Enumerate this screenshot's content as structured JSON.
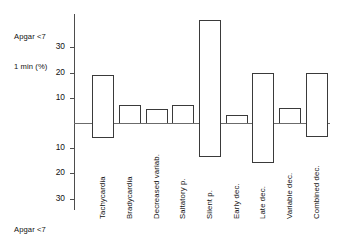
{
  "axis": {
    "top_caption_line1": "Apgar <7",
    "top_caption_line2": "1 min (%)",
    "bottom_caption_line1": "Apgar <7",
    "bottom_caption_line2": "5 min (%)",
    "upper_ticks": [
      "30",
      "20",
      "10"
    ],
    "lower_ticks": [
      "10",
      "20",
      "30"
    ]
  },
  "chart_data": {
    "type": "bar",
    "title": "",
    "subtitle": "",
    "xlabel": "",
    "ylabel": "Apgar <7 (%)",
    "grid": false,
    "legend_position": "none",
    "orientation": "vertical",
    "style": "diverging back-to-back bars, hollow white fill with black outline",
    "axis_note": "Upward bars = Apgar <7 at 1 min (%); downward bars = Apgar <7 at 5 min (%)",
    "ylim": [
      -35,
      45
    ],
    "yticks_upper": [
      10,
      20,
      30
    ],
    "yticks_lower": [
      10,
      20,
      30
    ],
    "zero_line": 0,
    "categories": [
      "Tachycardia",
      "Bradycardia",
      "Decreased variab.",
      "Saltatory p.",
      "Silent p.",
      "Early dec.",
      "Late dec.",
      "Variable dec.",
      "Combined dec."
    ],
    "series": [
      {
        "name": "Apgar <7 1 min (%)",
        "direction": "up",
        "values": [
          19,
          7,
          5.5,
          7,
          41,
          3,
          20,
          6,
          20
        ]
      },
      {
        "name": "Apgar <7 5 min (%)",
        "direction": "down",
        "values": [
          6,
          0,
          0,
          0,
          13.5,
          0,
          16,
          0,
          5.5
        ]
      }
    ]
  }
}
